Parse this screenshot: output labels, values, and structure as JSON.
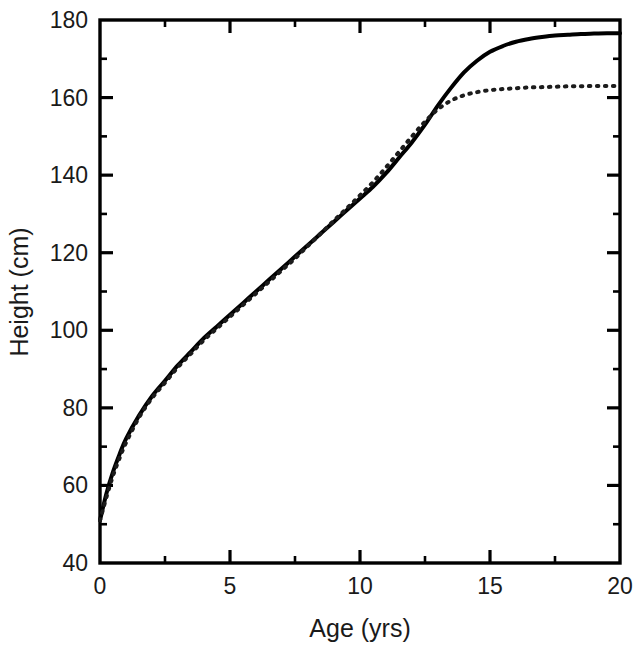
{
  "chart_data": {
    "type": "line",
    "title": "",
    "xlabel": "Age (yrs)",
    "ylabel": "Height (cm)",
    "xlim": [
      0,
      20
    ],
    "ylim": [
      40,
      180
    ],
    "grid": false,
    "legend": "none",
    "x_ticks": [
      0,
      5,
      10,
      15,
      20
    ],
    "x_tick_labels": [
      "0",
      "5",
      "10",
      "15",
      "20"
    ],
    "x_minor_ticks": [
      2.5,
      7.5,
      12.5,
      17.5
    ],
    "y_ticks": [
      40,
      60,
      80,
      100,
      120,
      140,
      160,
      180
    ],
    "y_tick_labels": [
      "40",
      "60",
      "80",
      "100",
      "120",
      "140",
      "160",
      "180"
    ],
    "y_minor_ticks": [
      50,
      70,
      90,
      110,
      130,
      150,
      170
    ],
    "x": [
      0,
      0.25,
      0.5,
      0.75,
      1,
      1.5,
      2,
      2.5,
      3,
      3.5,
      4,
      4.5,
      5,
      5.5,
      6,
      6.5,
      7,
      7.5,
      8,
      8.5,
      9,
      9.5,
      10,
      10.5,
      11,
      11.5,
      12,
      12.5,
      13,
      13.5,
      14,
      14.5,
      15,
      15.5,
      16,
      16.5,
      17,
      17.5,
      18,
      18.5,
      19,
      19.5,
      20
    ],
    "series": [
      {
        "name": "solid-curve",
        "style": "solid",
        "color": "#000000",
        "values": [
          51.0,
          58.0,
          63.5,
          68.0,
          72.0,
          78.0,
          83.0,
          87.0,
          91.0,
          94.5,
          98.0,
          101.0,
          104.0,
          107.0,
          110.0,
          113.0,
          116.0,
          119.0,
          122.0,
          125.0,
          128.0,
          131.0,
          134.0,
          137.0,
          140.5,
          144.5,
          148.5,
          153.0,
          158.0,
          162.5,
          166.5,
          169.5,
          171.8,
          173.3,
          174.4,
          175.1,
          175.6,
          176.0,
          176.2,
          176.4,
          176.5,
          176.6,
          176.6
        ]
      },
      {
        "name": "dotted-curve",
        "style": "dotted",
        "color": "#1c1c1c",
        "values": [
          51.0,
          57.0,
          62.5,
          67.0,
          71.0,
          77.5,
          82.5,
          86.5,
          90.5,
          94.0,
          97.5,
          100.5,
          103.5,
          106.5,
          109.5,
          112.5,
          115.5,
          118.5,
          121.8,
          125.0,
          128.3,
          131.5,
          134.8,
          138.2,
          142.0,
          146.0,
          150.0,
          153.8,
          157.0,
          159.2,
          160.6,
          161.4,
          161.9,
          162.2,
          162.4,
          162.6,
          162.7,
          162.8,
          162.9,
          162.9,
          163.0,
          163.0,
          163.0
        ]
      }
    ]
  },
  "axes": {
    "x_label": "Age (yrs)",
    "y_label": "Height (cm)"
  }
}
